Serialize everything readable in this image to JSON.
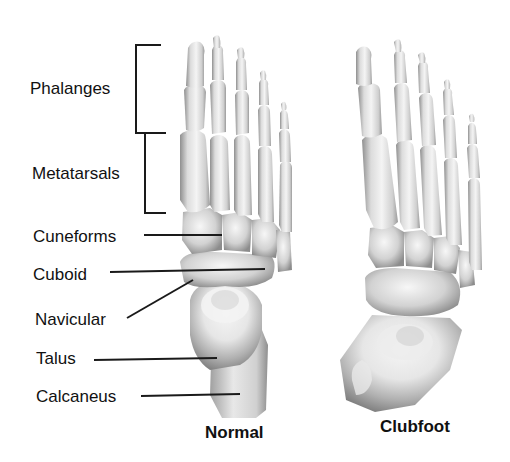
{
  "diagram": {
    "labels": [
      {
        "id": "phalanges",
        "text": "Phalanges",
        "x": 30,
        "y": 80,
        "pointer": "bracket"
      },
      {
        "id": "metatarsals",
        "text": "Metatarsals",
        "x": 32,
        "y": 165,
        "pointer": "bracket"
      },
      {
        "id": "cuneiforms",
        "text": "Cuneforms",
        "x": 33,
        "y": 229,
        "pointer": "line"
      },
      {
        "id": "cuboid",
        "text": "Cuboid",
        "x": 33,
        "y": 266,
        "pointer": "line"
      },
      {
        "id": "navicular",
        "text": "Navicular",
        "x": 35,
        "y": 312,
        "pointer": "line"
      },
      {
        "id": "talus",
        "text": "Talus",
        "x": 36,
        "y": 350,
        "pointer": "line"
      },
      {
        "id": "calcaneus",
        "text": "Calcaneus",
        "x": 36,
        "y": 388,
        "pointer": "line"
      }
    ],
    "captions": {
      "normal": "Normal",
      "clubfoot": "Clubfoot"
    },
    "colors": {
      "background": "#ffffff",
      "text": "#111111",
      "lines": "#1a1a1a",
      "bone_light": "#f2f2f2",
      "bone_mid": "#c8c8c8",
      "bone_dark": "#8a8a8a"
    }
  }
}
